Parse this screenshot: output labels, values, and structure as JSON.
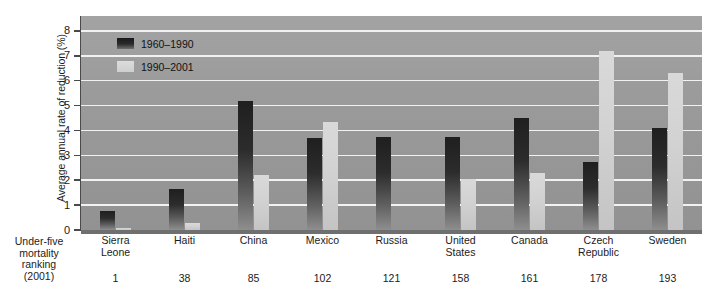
{
  "chart_data": {
    "type": "bar",
    "title": "",
    "xlabel": "Under-five mortality ranking (2001)",
    "ylabel": "Average annual rate of reduction (%)",
    "ylim": [
      0,
      8.6
    ],
    "yticks": [
      0,
      1,
      2,
      3,
      4,
      5,
      6,
      7,
      8
    ],
    "grid": true,
    "legend_position": "top-left",
    "categories": [
      "Sierra Leone",
      "Haiti",
      "China",
      "Mexico",
      "Russia",
      "United States",
      "Canada",
      "Czech Republic",
      "Sweden"
    ],
    "category_lines": [
      [
        "Sierra",
        "Leone"
      ],
      [
        "Haiti"
      ],
      [
        "China"
      ],
      [
        "Mexico"
      ],
      [
        "Russia"
      ],
      [
        "United",
        "States"
      ],
      [
        "Canada"
      ],
      [
        "Czech",
        "Republic"
      ],
      [
        "Sweden"
      ]
    ],
    "ranks": [
      "1",
      "38",
      "85",
      "102",
      "121",
      "158",
      "161",
      "178",
      "193"
    ],
    "series": [
      {
        "name": "1960–1990",
        "color": "#252525",
        "values": [
          0.75,
          1.65,
          5.2,
          3.7,
          3.75,
          3.75,
          4.5,
          2.75,
          4.1
        ]
      },
      {
        "name": "1990–2001",
        "color": "#d4d4d4",
        "values": [
          0.1,
          0.3,
          2.2,
          4.35,
          0.0,
          2.05,
          2.3,
          7.2,
          6.3
        ]
      }
    ]
  },
  "axis": {
    "y_title": "Average annual rate of reduction (%)",
    "y_tick_labels": [
      "8",
      "7",
      "6",
      "5",
      "4",
      "3",
      "2",
      "1",
      "0"
    ],
    "x_corner_lines": [
      "Under-five",
      "mortality",
      "ranking",
      "(2001)"
    ]
  },
  "legend": {
    "items": [
      {
        "label": "1960–1990",
        "swatch": "dark"
      },
      {
        "label": "1990–2001",
        "swatch": "light"
      }
    ]
  },
  "colors": {
    "plot_background": "#9a9a9a",
    "gridline": "#f2f2f2",
    "series_dark": "#252525",
    "series_light": "#d4d4d4",
    "text": "#1b1b1b",
    "page_background": "#ffffff"
  }
}
